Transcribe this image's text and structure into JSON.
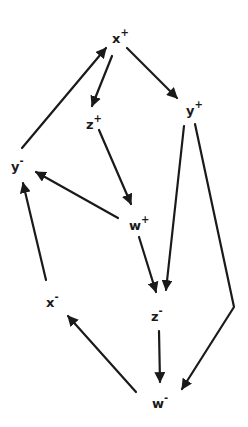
{
  "diagram": {
    "type": "directed-graph",
    "ink_color": "#1a1a1a",
    "background": "#ffffff",
    "nodes": [
      {
        "id": "xp",
        "base": "x",
        "sign": "+",
        "x": 118,
        "y": 38
      },
      {
        "id": "yp",
        "base": "y",
        "sign": "+",
        "x": 192,
        "y": 110
      },
      {
        "id": "zp",
        "base": "z",
        "sign": "+",
        "x": 92,
        "y": 124
      },
      {
        "id": "ym",
        "base": "y",
        "sign": "-",
        "x": 17,
        "y": 166
      },
      {
        "id": "wp",
        "base": "w",
        "sign": "+",
        "x": 135,
        "y": 225
      },
      {
        "id": "xm",
        "base": "x",
        "sign": "-",
        "x": 52,
        "y": 302
      },
      {
        "id": "zm",
        "base": "z",
        "sign": "-",
        "x": 157,
        "y": 316
      },
      {
        "id": "wm",
        "base": "w",
        "sign": "-",
        "x": 158,
        "y": 403
      }
    ],
    "edges": [
      {
        "from": "ym",
        "to": "xp",
        "points": [
          [
            22,
            148
          ],
          [
            106,
            48
          ]
        ]
      },
      {
        "from": "xp",
        "to": "zp",
        "points": [
          [
            112,
            56
          ],
          [
            92,
            106
          ]
        ]
      },
      {
        "from": "xp",
        "to": "yp",
        "points": [
          [
            127,
            48
          ],
          [
            177,
            98
          ]
        ]
      },
      {
        "from": "zp",
        "to": "wp",
        "points": [
          [
            99,
            130
          ],
          [
            131,
            204
          ]
        ]
      },
      {
        "from": "wp",
        "to": "ym",
        "points": [
          [
            118,
            218
          ],
          [
            36,
            172
          ]
        ]
      },
      {
        "from": "wp",
        "to": "zm",
        "points": [
          [
            139,
            237
          ],
          [
            156,
            292
          ]
        ]
      },
      {
        "from": "yp",
        "to": "zm",
        "points": [
          [
            184,
            126
          ],
          [
            166,
            290
          ]
        ]
      },
      {
        "from": "yp",
        "to": "wm",
        "points": [
          [
            195,
            124
          ],
          [
            234,
            307
          ],
          [
            182,
            389
          ]
        ]
      },
      {
        "from": "zm",
        "to": "wm",
        "points": [
          [
            159,
            331
          ],
          [
            160,
            382
          ]
        ]
      },
      {
        "from": "wm",
        "to": "xm",
        "points": [
          [
            136,
            392
          ],
          [
            68,
            316
          ]
        ]
      },
      {
        "from": "xm",
        "to": "ym",
        "points": [
          [
            46,
            280
          ],
          [
            23,
            183
          ]
        ]
      }
    ]
  }
}
